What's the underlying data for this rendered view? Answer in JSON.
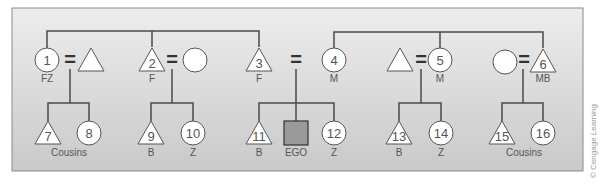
{
  "colors": {
    "panel_top": "#ececec",
    "panel_bottom": "#c8c8c8",
    "panel_border": "#8a8a8a",
    "line": "#4a4a4a",
    "shape_fill": "#ffffff",
    "shape_stroke": "#555555",
    "ego_fill": "#9a9a9a",
    "text": "#555555"
  },
  "legend": {
    "symbols": {
      "triangle": "male",
      "circle": "female",
      "square": "ego",
      "equals": "marriage"
    }
  },
  "nodes": [
    {
      "id": "1",
      "shape": "circle",
      "label": "FZ"
    },
    {
      "id": "",
      "shape": "triangle",
      "label": ""
    },
    {
      "id": "2",
      "shape": "triangle",
      "label": "F"
    },
    {
      "id": "",
      "shape": "circle",
      "label": ""
    },
    {
      "id": "3",
      "shape": "triangle",
      "label": "F"
    },
    {
      "id": "4",
      "shape": "circle",
      "label": "M"
    },
    {
      "id": "",
      "shape": "triangle",
      "label": ""
    },
    {
      "id": "5",
      "shape": "circle",
      "label": "M"
    },
    {
      "id": "",
      "shape": "circle",
      "label": ""
    },
    {
      "id": "6",
      "shape": "triangle",
      "label": "MB"
    },
    {
      "id": "7",
      "shape": "triangle",
      "label": ""
    },
    {
      "id": "8",
      "shape": "circle",
      "label": ""
    },
    {
      "id": "9",
      "shape": "triangle",
      "label": "B"
    },
    {
      "id": "10",
      "shape": "circle",
      "label": "Z"
    },
    {
      "id": "11",
      "shape": "triangle",
      "label": "B"
    },
    {
      "id": "EGO",
      "shape": "square",
      "label": "EGO"
    },
    {
      "id": "12",
      "shape": "circle",
      "label": "Z"
    },
    {
      "id": "13",
      "shape": "triangle",
      "label": "B"
    },
    {
      "id": "14",
      "shape": "circle",
      "label": "Z"
    },
    {
      "id": "15",
      "shape": "triangle",
      "label": ""
    },
    {
      "id": "16",
      "shape": "circle",
      "label": ""
    }
  ],
  "group_labels": {
    "left_cousins": "Cousins",
    "right_cousins": "Cousins"
  },
  "marriage_symbol": "=",
  "credit": "© Cengage Learning"
}
